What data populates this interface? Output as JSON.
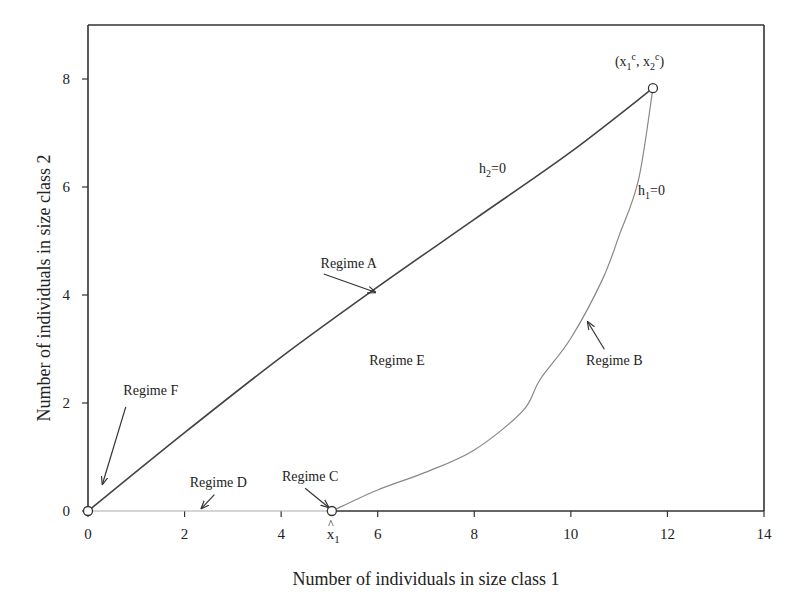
{
  "chart_data": {
    "type": "line",
    "title": "",
    "xlabel": "Number of individuals in size class 1",
    "ylabel": "Number of individuals in size class 2",
    "xlim": [
      0,
      14
    ],
    "ylim": [
      0,
      9
    ],
    "xticks": [
      0,
      2,
      4,
      6,
      8,
      10,
      12,
      14
    ],
    "yticks": [
      0,
      2,
      4,
      6,
      8
    ],
    "grid": false,
    "series": [
      {
        "name": "h2=0",
        "label": "h",
        "label_sub": "2",
        "label_suffix": "=0",
        "color": "#444444",
        "x": [
          0,
          2,
          4,
          6,
          8,
          10,
          11.7
        ],
        "y": [
          0,
          1.45,
          2.85,
          4.15,
          5.4,
          6.65,
          7.83
        ]
      },
      {
        "name": "h1=0",
        "label": "h",
        "label_sub": "1",
        "label_suffix": "=0",
        "color": "#888888",
        "x": [
          5.05,
          6,
          7,
          8,
          9,
          9.36,
          10,
          10.65,
          11,
          11.4,
          11.7
        ],
        "y": [
          0,
          0.39,
          0.72,
          1.13,
          1.85,
          2.43,
          3.2,
          4.28,
          5.1,
          6.13,
          7.83
        ]
      },
      {
        "name": "Regime D boundary",
        "color": "#aaaaaa",
        "x": [
          0,
          5.05
        ],
        "y": [
          0,
          0
        ]
      }
    ],
    "points": [
      {
        "name": "origin",
        "x": 0,
        "y": 0
      },
      {
        "name": "x1-hat",
        "x": 5.05,
        "y": 0,
        "label": "x",
        "label_sub": "1",
        "label_hat": "^"
      },
      {
        "name": "critical-point",
        "x": 11.7,
        "y": 7.83,
        "label": "(x1c, x2c)"
      }
    ],
    "annotations": [
      {
        "text": "Regime A",
        "x": 5.4,
        "y": 4.5,
        "arrow_to": [
          5.95,
          4.05
        ]
      },
      {
        "text": "Regime B",
        "x": 10.9,
        "y": 2.7,
        "arrow_to": [
          10.35,
          3.5
        ]
      },
      {
        "text": "Regime C",
        "x": 4.6,
        "y": 0.55,
        "arrow_to": [
          4.98,
          0.07
        ]
      },
      {
        "text": "Regime D",
        "x": 2.7,
        "y": 0.45,
        "arrow_to": [
          2.35,
          0.05
        ]
      },
      {
        "text": "Regime E",
        "x": 6.4,
        "y": 2.7
      },
      {
        "text": "Regime F",
        "x": 1.3,
        "y": 2.15,
        "arrow_to": [
          0.3,
          0.5
        ]
      }
    ],
    "critical_label": {
      "open": "(x",
      "sub1": "1",
      "sup1": "c",
      "mid": ", x",
      "sub2": "2",
      "sup2": "c",
      "close": ")"
    }
  }
}
